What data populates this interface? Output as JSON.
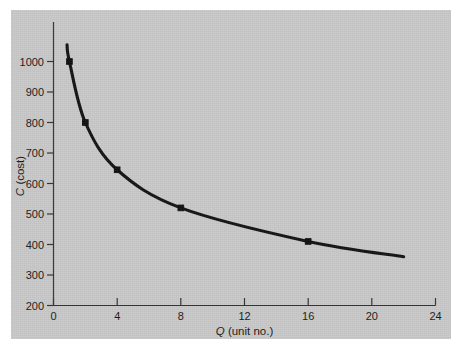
{
  "figure": {
    "background_color": "#ffffff",
    "panel_color": "#c9c9c9",
    "curve_color": "#141414",
    "axis_color": "#333333"
  },
  "chart_data": {
    "type": "line",
    "title": "",
    "subtitle": "",
    "xlabel_symbol": "Q",
    "xlabel_rest": " (unit no.)",
    "xlabel": "Q (unit no.)",
    "ylabel_symbol": "C",
    "ylabel_rest": " (cost)",
    "ylabel": "C (cost)",
    "xlim": [
      0,
      24
    ],
    "ylim": [
      200,
      1050
    ],
    "grid": false,
    "legend": "none",
    "xticks": [
      0,
      4,
      8,
      12,
      16,
      20,
      24
    ],
    "xtick_labels": [
      "0",
      "4",
      "8",
      "12",
      "16",
      "20",
      "24"
    ],
    "yticks": [
      200,
      300,
      400,
      500,
      600,
      700,
      800,
      900,
      1000
    ],
    "ytick_labels": [
      "200",
      "300",
      "400",
      "500",
      "600",
      "700",
      "800",
      "900",
      "1000"
    ],
    "series": [
      {
        "name": "learning curve",
        "marker": "square",
        "x": [
          1,
          2,
          4,
          8,
          16
        ],
        "values": [
          1000,
          800,
          645,
          520,
          410
        ],
        "curve_start": {
          "x": 0.85,
          "y": 1055
        },
        "curve_end": {
          "x": 22,
          "y": 360
        }
      }
    ]
  }
}
